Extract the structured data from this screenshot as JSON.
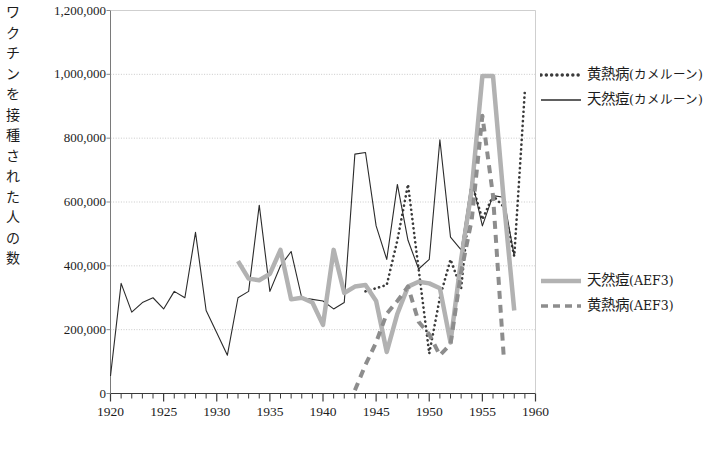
{
  "chart_data": {
    "type": "line",
    "title": "",
    "xlabel": "",
    "ylabel": "ワクチンを接種された人の数",
    "xlim": [
      1920,
      1960
    ],
    "ylim": [
      0,
      1200000
    ],
    "xticks": [
      1920,
      1925,
      1930,
      1935,
      1940,
      1945,
      1950,
      1955,
      1960
    ],
    "xtick_labels": [
      "1920",
      "1925",
      "1930",
      "1935",
      "1940",
      "1945",
      "1950",
      "1955",
      "1960"
    ],
    "x_minor_tick_step": 1,
    "yticks": [
      0,
      200000,
      400000,
      600000,
      800000,
      1000000,
      1200000
    ],
    "ytick_labels": [
      "0",
      "200,000",
      "400,000",
      "600,000",
      "800,000",
      "1,000,000",
      "1,200,000"
    ],
    "grid": "horizontal-dotted",
    "legend_position": "right",
    "series": [
      {
        "name": "黄熱病(カメルーン)",
        "key": "yellow_fever_cameroon",
        "style": "dotted",
        "color": "#3a3a3a",
        "width": 2.6,
        "x": [
          1944,
          1945,
          1946,
          1947,
          1948,
          1949,
          1950,
          1951,
          1952,
          1953,
          1954,
          1955,
          1956,
          1957,
          1958,
          1959
        ],
        "y": [
          320000,
          330000,
          340000,
          480000,
          655000,
          390000,
          125000,
          300000,
          420000,
          330000,
          660000,
          545000,
          620000,
          585000,
          430000,
          950000
        ]
      },
      {
        "name": "天然痘(カメルーン)",
        "key": "smallpox_cameroon",
        "style": "solid",
        "color": "#2b2b2b",
        "width": 1.1,
        "x": [
          1920,
          1921,
          1922,
          1923,
          1924,
          1925,
          1926,
          1927,
          1928,
          1929,
          1930,
          1931,
          1932,
          1933,
          1934,
          1935,
          1936,
          1937,
          1938,
          1939,
          1940,
          1941,
          1942,
          1943,
          1944,
          1945,
          1946,
          1947,
          1948,
          1949,
          1950,
          1951,
          1952,
          1953,
          1954,
          1955,
          1956,
          1957,
          1958
        ],
        "y": [
          55000,
          345000,
          255000,
          285000,
          300000,
          265000,
          320000,
          300000,
          505000,
          260000,
          190000,
          120000,
          300000,
          320000,
          590000,
          320000,
          400000,
          445000,
          300000,
          295000,
          290000,
          265000,
          285000,
          750000,
          755000,
          525000,
          420000,
          655000,
          480000,
          390000,
          420000,
          795000,
          490000,
          450000,
          670000,
          525000,
          620000,
          615000,
          430000
        ]
      },
      {
        "name": "天然痘(AEF3)",
        "key": "smallpox_aef3",
        "style": "solid",
        "color": "#b2b2b2",
        "width": 4.5,
        "x": [
          1932,
          1933,
          1934,
          1935,
          1936,
          1937,
          1938,
          1939,
          1940,
          1941,
          1942,
          1943,
          1944,
          1945,
          1946,
          1947,
          1948,
          1949,
          1950,
          1951,
          1952,
          1953,
          1954,
          1955,
          1956,
          1957,
          1958
        ],
        "y": [
          415000,
          360000,
          355000,
          375000,
          450000,
          295000,
          300000,
          285000,
          215000,
          450000,
          315000,
          335000,
          340000,
          290000,
          130000,
          250000,
          335000,
          350000,
          345000,
          330000,
          160000,
          420000,
          640000,
          995000,
          995000,
          610000,
          260000
        ]
      },
      {
        "name": "黄熱病(AEF3)",
        "key": "yellow_fever_aef3",
        "style": "dashed",
        "color": "#8d8d8d",
        "width": 4.0,
        "x": [
          1943,
          1944,
          1945,
          1946,
          1947,
          1948,
          1949,
          1950,
          1951,
          1952,
          1953,
          1954,
          1955,
          1956,
          1957
        ],
        "y": [
          10000,
          90000,
          160000,
          250000,
          290000,
          335000,
          225000,
          185000,
          120000,
          155000,
          380000,
          545000,
          870000,
          620000,
          120000
        ]
      }
    ]
  },
  "axis": {
    "y_title": "ワクチンを接種された人の数"
  },
  "legend": {
    "top_group": [
      {
        "label_main": "黄熱病",
        "label_paren": "(カメルーン)",
        "style": "dotted",
        "color": "#3a3a3a"
      },
      {
        "label_main": "天然痘",
        "label_paren": "(カメルーン)",
        "style": "solid-black",
        "color": "#2b2b2b"
      }
    ],
    "bottom_group": [
      {
        "label_main": "天然痘",
        "label_paren": "(AEF3)",
        "style": "solid-gray",
        "color": "#b2b2b2"
      },
      {
        "label_main": "黄熱病",
        "label_paren": "(AEF3)",
        "style": "dashed-gray",
        "color": "#8d8d8d"
      }
    ]
  },
  "caption": {
    "text": ""
  }
}
